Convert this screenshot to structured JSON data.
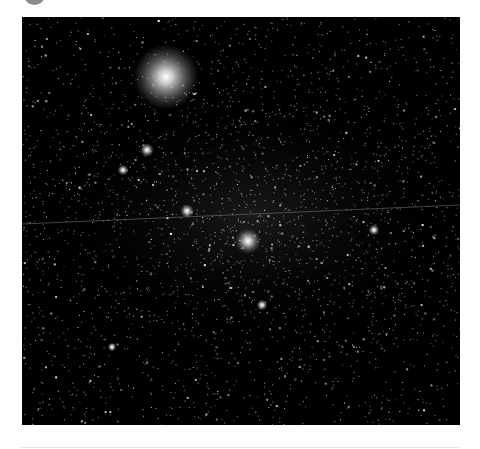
{
  "image": {
    "subject": "Star field with Milky Way band, bright star and satellite trail",
    "frame": {
      "x": 22,
      "y": 17,
      "width": 438,
      "height": 408
    },
    "background_color": "#000000",
    "bright_stars": [
      {
        "x": 144,
        "y": 60,
        "r": 7,
        "glow": 26
      },
      {
        "x": 226,
        "y": 224,
        "r": 3,
        "glow": 10
      },
      {
        "x": 165,
        "y": 194,
        "r": 2,
        "glow": 5
      },
      {
        "x": 125,
        "y": 133,
        "r": 2,
        "glow": 5
      },
      {
        "x": 101,
        "y": 153,
        "r": 1.6,
        "glow": 4
      },
      {
        "x": 352,
        "y": 213,
        "r": 1.6,
        "glow": 4
      },
      {
        "x": 240,
        "y": 288,
        "r": 1.6,
        "glow": 4
      },
      {
        "x": 90,
        "y": 330,
        "r": 1.4,
        "glow": 3
      }
    ],
    "trail": {
      "x1": 0,
      "y1": 207,
      "x2": 438,
      "y2": 188,
      "color": "#8a8a8a"
    },
    "milky_way": {
      "cx": 230,
      "cy": 200,
      "rx": 200,
      "ry": 120
    }
  },
  "avatar": {
    "color": "#8a8a8a"
  }
}
